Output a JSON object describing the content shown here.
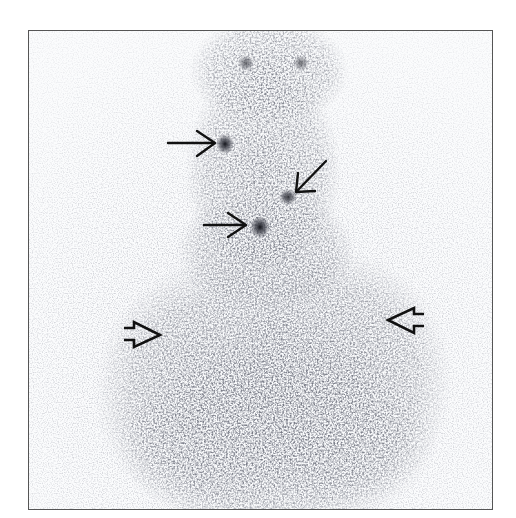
{
  "image": {
    "type": "nuclear-medicine-scintigraphy",
    "view": "anterior neck and upper chest",
    "colormap": "inverted grayscale",
    "frame": {
      "x": 28,
      "y": 30,
      "width": 465,
      "height": 480,
      "border_color": "#555555"
    },
    "background_color": "#ffffff",
    "uptake_color": "#2b2d36"
  },
  "annotations": {
    "line_arrows": [
      {
        "id": "arrow-1",
        "style": "thin",
        "direction": "right",
        "tail": [
          168,
          143
        ],
        "head": [
          216,
          143
        ],
        "target": "focal uptake, left upper neck"
      },
      {
        "id": "arrow-2",
        "style": "thin",
        "direction": "down-left",
        "tail": [
          326,
          160
        ],
        "head": [
          296,
          192
        ],
        "target": "focal uptake, right mid neck"
      },
      {
        "id": "arrow-3",
        "style": "thin",
        "direction": "right",
        "tail": [
          204,
          225
        ],
        "head": [
          246,
          225
        ],
        "target": "focal uptake, lower neck"
      }
    ],
    "open_arrows": [
      {
        "id": "open-arrow-left",
        "style": "open-outline",
        "direction": "right",
        "position": [
          124,
          333
        ],
        "target": "diffuse uptake, right chest"
      },
      {
        "id": "open-arrow-right",
        "style": "open-outline",
        "direction": "left",
        "position": [
          424,
          320
        ],
        "target": "diffuse uptake, left chest"
      }
    ],
    "hot_spots": [
      {
        "x": 222,
        "y": 143,
        "intensity": "moderate"
      },
      {
        "x": 287,
        "y": 196,
        "intensity": "mild"
      },
      {
        "x": 258,
        "y": 226,
        "intensity": "high"
      }
    ],
    "arrow_color": "#111111"
  }
}
